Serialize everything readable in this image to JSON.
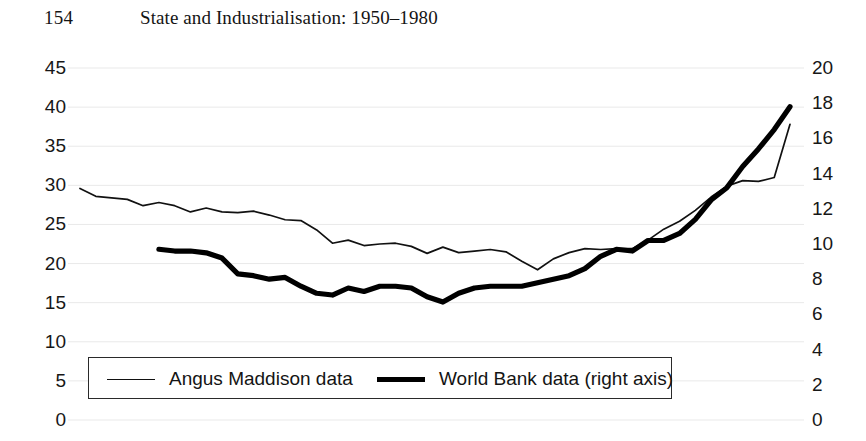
{
  "running_head": {
    "folio": "154",
    "title": "State and Industrialisation: 1950–1980"
  },
  "legend": {
    "entries": [
      {
        "label": "Angus Maddison data",
        "style": "thin",
        "color": "#111111"
      },
      {
        "label": "World Bank data (right axis)",
        "style": "thick",
        "color": "#000000"
      }
    ]
  },
  "chart_data": {
    "type": "line",
    "title": "",
    "subtitle": "",
    "xlabel": "",
    "ylabel": "",
    "grid": true,
    "legend_position": "bottom-left-inside",
    "axes": {
      "left": {
        "label": "",
        "ylim": [
          0,
          45
        ],
        "ticks": [
          0,
          5,
          10,
          15,
          20,
          25,
          30,
          35,
          40,
          45
        ],
        "tick_labels": [
          "0",
          "5",
          "10",
          "15",
          "20",
          "25",
          "30",
          "35",
          "40",
          "45"
        ]
      },
      "right": {
        "label": "",
        "ylim": [
          0,
          20
        ],
        "ticks": [
          0,
          2,
          4,
          6,
          8,
          10,
          12,
          14,
          16,
          18,
          20
        ],
        "tick_labels": [
          "0",
          "2",
          "4",
          "6",
          "8",
          "10",
          "12",
          "14",
          "16",
          "18",
          "20"
        ]
      },
      "x": {
        "label": "",
        "tick_labels_visible": false,
        "note": "x tick labels cropped off bottom edge of screenshot"
      }
    },
    "series": [
      {
        "name": "Angus Maddison data",
        "axis": "left",
        "style": "thin",
        "color": "#111111",
        "x": [
          0,
          1,
          2,
          3,
          4,
          5,
          6,
          7,
          8,
          9,
          10,
          11,
          12,
          13,
          14,
          15,
          16,
          17,
          18,
          19,
          20,
          21,
          22,
          23,
          24,
          25,
          26,
          27,
          28,
          29,
          30,
          31,
          32,
          33,
          34,
          35,
          36,
          37,
          38,
          39,
          40,
          41,
          42,
          43,
          44,
          45
        ],
        "values": [
          29.6,
          28.6,
          28.4,
          28.2,
          27.4,
          27.8,
          27.4,
          26.6,
          27.1,
          26.6,
          26.5,
          26.7,
          26.2,
          25.6,
          25.5,
          24.3,
          22.6,
          23.0,
          22.3,
          22.5,
          22.6,
          22.2,
          21.3,
          22.1,
          21.4,
          21.6,
          21.8,
          21.5,
          20.3,
          19.2,
          20.6,
          21.4,
          21.9,
          21.8,
          21.9,
          21.9,
          23.0,
          24.4,
          25.4,
          26.8,
          28.5,
          29.9,
          30.6,
          30.5,
          31.0,
          37.8
        ]
      },
      {
        "name": "World Bank data (right axis)",
        "axis": "right",
        "style": "thick",
        "color": "#000000",
        "x": [
          5,
          6,
          7,
          8,
          9,
          10,
          11,
          12,
          13,
          14,
          15,
          16,
          17,
          18,
          19,
          20,
          21,
          22,
          23,
          24,
          25,
          26,
          27,
          28,
          29,
          30,
          31,
          32,
          33,
          34,
          35,
          36,
          37,
          38,
          39,
          40,
          41,
          42,
          43,
          44,
          45
        ],
        "values": [
          9.7,
          9.6,
          9.6,
          9.5,
          9.2,
          8.3,
          8.2,
          8.0,
          8.1,
          7.6,
          7.2,
          7.1,
          7.5,
          7.3,
          7.6,
          7.6,
          7.5,
          7.0,
          6.7,
          7.2,
          7.5,
          7.6,
          7.6,
          7.6,
          7.8,
          8.0,
          8.2,
          8.6,
          9.3,
          9.7,
          9.6,
          10.2,
          10.2,
          10.6,
          11.4,
          12.5,
          13.2,
          14.4,
          15.4,
          16.5,
          17.8
        ]
      }
    ]
  }
}
